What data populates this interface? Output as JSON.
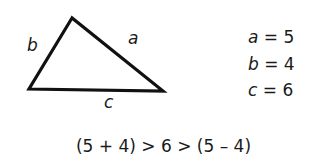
{
  "diagram": {
    "triangle": {
      "vertices": [
        [
          72,
          18
        ],
        [
          29,
          89
        ],
        [
          163,
          91
        ]
      ],
      "stroke_color": "#111111",
      "side_labels": {
        "a": "a",
        "b": "b",
        "c": "c"
      }
    },
    "values": [
      {
        "var": "a",
        "text": " = 5"
      },
      {
        "var": "b",
        "text": " = 4"
      },
      {
        "var": "c",
        "text": " = 6"
      }
    ],
    "inequality": "(5 + 4) > 6 > (5 – 4)"
  }
}
